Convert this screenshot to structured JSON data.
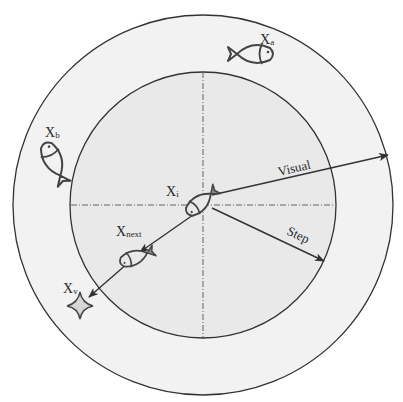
{
  "diagram": {
    "type": "fish-swarm-perception-model",
    "colors": {
      "background": "#ffffff",
      "outer_ring_fill": "#f2f2f2",
      "inner_disk_fill": "#e9e9e9",
      "stroke": "#333333",
      "fish_stroke": "#444444",
      "star_fill": "#d6d6d6"
    },
    "circles": {
      "center": [
        203,
        205
      ],
      "outer_radius": 190,
      "inner_radius": 133
    },
    "arrows": {
      "visual": {
        "label": "Visual",
        "from": [
          212,
          195
        ],
        "to": [
          388,
          155
        ]
      },
      "step": {
        "label": "Step",
        "from": [
          212,
          208
        ],
        "to": [
          324,
          261
        ]
      },
      "to_next": {
        "from": [
          193,
          215
        ],
        "to": [
          138,
          253
        ]
      },
      "to_xv": {
        "from": [
          128,
          262
        ],
        "to": [
          88,
          297
        ]
      }
    },
    "nodes": [
      {
        "id": "Xi",
        "main": "X",
        "sub": "i",
        "icon": "fish-icon",
        "position": [
          201,
          202
        ]
      },
      {
        "id": "Xa",
        "main": "X",
        "sub": "a",
        "icon": "fish-icon",
        "position": [
          252,
          54
        ]
      },
      {
        "id": "Xb",
        "main": "X",
        "sub": "b",
        "icon": "fish-icon",
        "position": [
          54,
          162
        ]
      },
      {
        "id": "Xnext",
        "main": "X",
        "sub": "next",
        "icon": "fish-icon",
        "position": [
          134,
          258
        ]
      },
      {
        "id": "Xv",
        "main": "X",
        "sub": "v",
        "icon": "star-icon",
        "position": [
          80,
          305
        ]
      }
    ],
    "labels": {
      "Xi": {
        "main": "X",
        "sub": "i"
      },
      "Xa": {
        "main": "X",
        "sub": "a"
      },
      "Xb": {
        "main": "X",
        "sub": "b"
      },
      "Xnext": {
        "main": "X",
        "sub": "next"
      },
      "Xv": {
        "main": "X",
        "sub": "v"
      },
      "visual": "Visual",
      "step": "Step"
    }
  }
}
